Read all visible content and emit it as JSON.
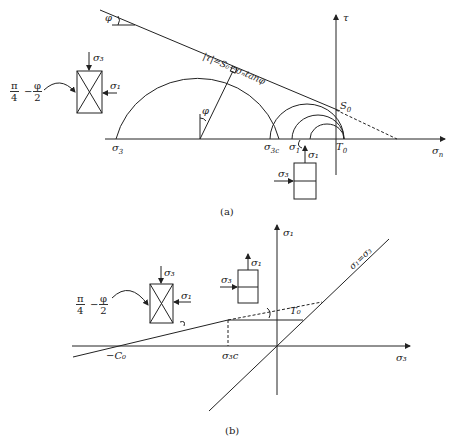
{
  "figure_a": {
    "caption": "(a)",
    "axis_tau": "τ",
    "axis_sigma_n": "σ",
    "axis_sigma_n_sub": "n",
    "criterion": "|τ|=S₀−σₙtanφ",
    "phi_top": "φ",
    "phi_center": "φ",
    "sigma3": "σ",
    "sigma3_sub": "3",
    "sigma3c": "σ",
    "sigma3c_sub": "3c",
    "sigma1": "σ",
    "sigma1_sub": "1",
    "T0": "T",
    "T0_sub": "0",
    "S0": "S",
    "S0_sub": "0",
    "element_left": {
      "top": "σ₃",
      "right": "σ₁"
    },
    "element_bottom": {
      "top": "σ₁",
      "left": "σ₃"
    },
    "angle_fraction": {
      "a_num": "π",
      "a_den": "4",
      "minus": "−",
      "b_num": "φ",
      "b_den": "2"
    }
  },
  "figure_b": {
    "caption": "(b)",
    "axis_sigma1": "σ₁",
    "axis_sigma3": "σ₃",
    "minus_C0": "−C₀",
    "sigma3c": "σ₃c",
    "T0": "T₀",
    "line_label": "σ₁=σ₃",
    "element_left": {
      "top": "σ₃",
      "right": "σ₁"
    },
    "element_right": {
      "top": "σ₁",
      "left": "σ₃"
    },
    "angle_fraction": {
      "a_num": "π",
      "a_den": "4",
      "minus": "−",
      "b_num": "φ",
      "b_den": "2"
    }
  }
}
